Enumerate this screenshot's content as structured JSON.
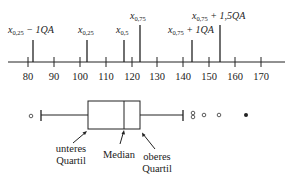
{
  "diagram": {
    "type": "boxplot-annotated",
    "axis": {
      "min_visible": 72,
      "max_visible": 180,
      "ticks": [
        80,
        90,
        100,
        110,
        120,
        130,
        140,
        150,
        160,
        170
      ],
      "tick_labels": [
        "80",
        "90",
        "100",
        "110",
        "120",
        "130",
        "140",
        "150",
        "160",
        "170"
      ]
    },
    "markers": [
      {
        "id": "q25_minus_1qa",
        "value": 82,
        "label_main": "x",
        "label_sub": "0,25",
        "label_rest": " − 1QA",
        "row": "lower"
      },
      {
        "id": "q25",
        "value": 103,
        "label_main": "x",
        "label_sub": "0,25",
        "label_rest": "",
        "row": "lower"
      },
      {
        "id": "median",
        "value": 117,
        "label_main": "x",
        "label_sub": "0,5",
        "label_rest": "",
        "row": "lower"
      },
      {
        "id": "q75",
        "value": 123,
        "label_main": "x",
        "label_sub": "0,75",
        "label_rest": "",
        "row": "upper"
      },
      {
        "id": "q75_plus_1qa",
        "value": 143,
        "label_main": "x",
        "label_sub": "0,75",
        "label_rest": " + 1QA",
        "row": "lower"
      },
      {
        "id": "q75_plus_15qa",
        "value": 154,
        "label_main": "x",
        "label_sub": "0,75",
        "label_rest": " + 1,5QA",
        "row": "upper"
      }
    ],
    "boxplot": {
      "lower_whisker": 84,
      "q1": 103,
      "median": 117,
      "q3": 123,
      "upper_whisker": 143,
      "outliers_open": [
        82,
        147,
        147,
        151,
        157
      ],
      "outliers_filled": [
        167
      ]
    },
    "captions": {
      "lower_quartile_line1": "unteres",
      "lower_quartile_line2": "Quartil",
      "median": "Median",
      "upper_quartile_line1": "oberes",
      "upper_quartile_line2": "Quartil"
    }
  }
}
